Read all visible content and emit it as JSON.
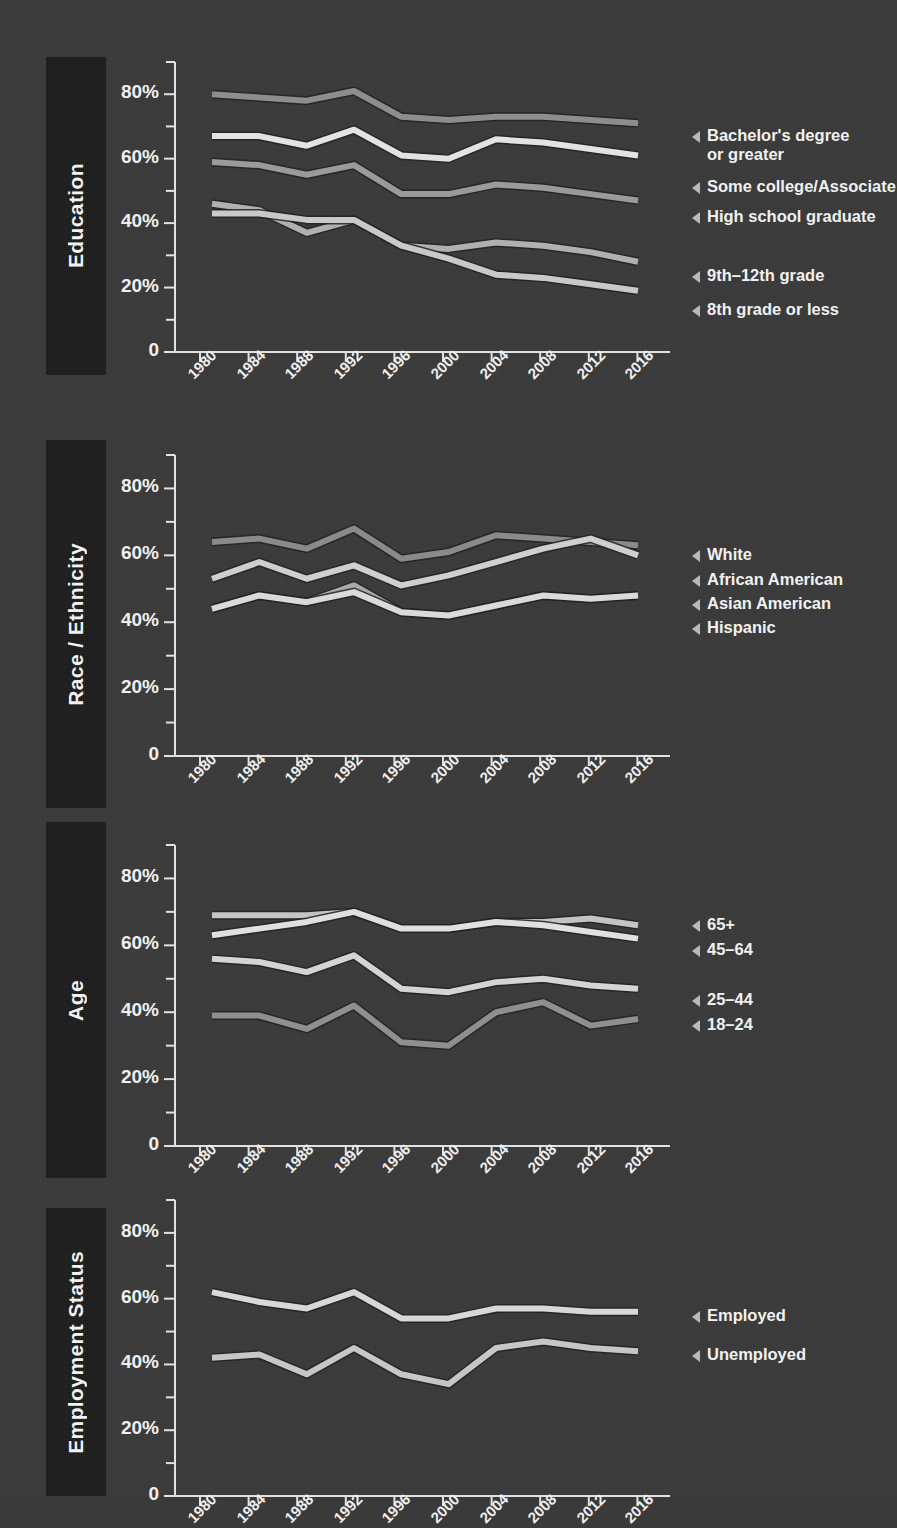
{
  "figure": {
    "background_color": "#3a3a3a",
    "tab_color": "#1c1c1c",
    "text_color": "#f0f0f0"
  },
  "axis": {
    "y_tick_labels": [
      "80%",
      "60%",
      "40%",
      "20%",
      "0"
    ],
    "y_tick_values": [
      80,
      60,
      40,
      20,
      0
    ],
    "y_minor_step": 10,
    "ylim": [
      0,
      90
    ],
    "x_tick_labels": [
      "1980",
      "1984",
      "1988",
      "1992",
      "1996",
      "2000",
      "2004",
      "2008",
      "2012",
      "2016"
    ]
  },
  "panels": [
    {
      "tab_label": "Education",
      "chart_data": {
        "type": "line",
        "title": "Education",
        "xlabel": "",
        "ylabel": "",
        "ylim": [
          0,
          90
        ],
        "grid": false,
        "legend_position": "right",
        "x": [
          1980,
          1984,
          1988,
          1992,
          1996,
          2000,
          2004,
          2008,
          2012,
          2016
        ],
        "series": [
          {
            "name": "Bachelor's degree or greater",
            "label_line1": "Bachelor's degree",
            "label_line2": "or greater",
            "color": "#8d8d8d",
            "values": [
              80,
              79,
              78,
              81,
              73,
              72,
              73,
              73,
              72,
              71
            ]
          },
          {
            "name": "Some college/Associate",
            "label_line1": "Some college/Associate",
            "label_line2": "",
            "color": "#e3e3e3",
            "values": [
              67,
              67,
              64,
              69,
              61,
              60,
              66,
              65,
              63,
              61
            ]
          },
          {
            "name": "High school graduate",
            "label_line1": "High school graduate",
            "label_line2": "",
            "color": "#9a9a9a",
            "values": [
              59,
              58,
              55,
              58,
              49,
              49,
              52,
              51,
              49,
              47
            ]
          },
          {
            "name": "9th–12th grade",
            "label_line1": "9th–12th grade",
            "label_line2": "",
            "color": "#b0b0b0",
            "values": [
              46,
              44,
              37,
              41,
              33,
              32,
              34,
              33,
              31,
              28
            ]
          },
          {
            "name": "8th grade or less",
            "label_line1": "8th grade or less",
            "label_line2": "",
            "color": "#c9c9c9",
            "values": [
              43,
              43,
              41,
              41,
              33,
              29,
              24,
              23,
              21,
              19
            ]
          }
        ]
      }
    },
    {
      "tab_label": "Race / Ethnicity",
      "chart_data": {
        "type": "line",
        "title": "Race / Ethnicity",
        "xlabel": "",
        "ylabel": "",
        "ylim": [
          0,
          90
        ],
        "grid": false,
        "legend_position": "right",
        "x": [
          1980,
          1984,
          1988,
          1992,
          1996,
          2000,
          2004,
          2008,
          2012,
          2016
        ],
        "series": [
          {
            "name": "White",
            "label_line1": "White",
            "label_line2": "",
            "color": "#8a8a8a",
            "values": [
              64,
              65,
              62,
              68,
              59,
              61,
              66,
              65,
              64,
              63
            ]
          },
          {
            "name": "African American",
            "label_line1": "African American",
            "label_line2": "",
            "color": "#cfcfcf",
            "values": [
              53,
              58,
              53,
              57,
              51,
              54,
              58,
              62,
              65,
              60
            ]
          },
          {
            "name": "Asian American",
            "label_line1": "Asian American",
            "label_line2": "",
            "color": "#a8a8a8",
            "values": [
              44,
              48,
              46,
              51,
              43,
              42,
              45,
              48,
              47,
              48
            ]
          },
          {
            "name": "Hispanic",
            "label_line1": "Hispanic",
            "label_line2": "",
            "color": "#dadada",
            "values": [
              44,
              48,
              46,
              49,
              43,
              42,
              45,
              48,
              47,
              48
            ]
          }
        ]
      }
    },
    {
      "tab_label": "Age",
      "chart_data": {
        "type": "line",
        "title": "Age",
        "xlabel": "",
        "ylabel": "",
        "ylim": [
          0,
          90
        ],
        "grid": false,
        "legend_position": "right",
        "x": [
          1980,
          1984,
          1988,
          1992,
          1996,
          2000,
          2004,
          2008,
          2012,
          2016
        ],
        "series": [
          {
            "name": "65+",
            "label_line1": "65+",
            "label_line2": "",
            "color": "#c4c4c4",
            "values": [
              69,
              69,
              69,
              70,
              65,
              65,
              67,
              67,
              68,
              66
            ]
          },
          {
            "name": "45–64",
            "label_line1": "45–64",
            "label_line2": "",
            "color": "#e0e0e0",
            "values": [
              63,
              65,
              67,
              70,
              65,
              65,
              67,
              66,
              64,
              62
            ]
          },
          {
            "name": "25–44",
            "label_line1": "25–44",
            "label_line2": "",
            "color": "#d4d4d4",
            "values": [
              56,
              55,
              52,
              57,
              47,
              46,
              49,
              50,
              48,
              47
            ]
          },
          {
            "name": "18–24",
            "label_line1": "18–24",
            "label_line2": "",
            "color": "#8f8f8f",
            "values": [
              39,
              39,
              35,
              42,
              31,
              30,
              40,
              43,
              36,
              38
            ]
          }
        ]
      }
    },
    {
      "tab_label": "Employment Status",
      "chart_data": {
        "type": "line",
        "title": "Employment Status",
        "xlabel": "",
        "ylabel": "",
        "ylim": [
          0,
          90
        ],
        "grid": false,
        "legend_position": "right",
        "x": [
          1980,
          1984,
          1988,
          1992,
          1996,
          2000,
          2004,
          2008,
          2012,
          2016
        ],
        "series": [
          {
            "name": "Employed",
            "label_line1": "Employed",
            "label_line2": "",
            "color": "#d8d8d8",
            "values": [
              62,
              59,
              57,
              62,
              54,
              54,
              57,
              57,
              56,
              56
            ]
          },
          {
            "name": "Unemployed",
            "label_line1": "Unemployed",
            "label_line2": "",
            "color": "#c6c6c6",
            "values": [
              42,
              43,
              37,
              45,
              37,
              34,
              45,
              47,
              45,
              44
            ]
          }
        ]
      }
    }
  ]
}
